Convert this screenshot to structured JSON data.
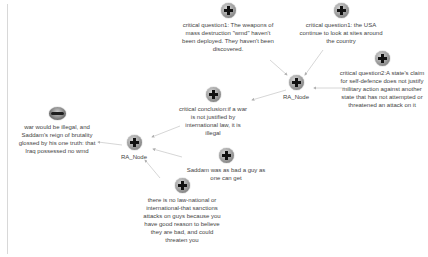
{
  "diagram": {
    "top_cutoff_text": "",
    "nodes": [
      {
        "id": "cq1",
        "icon": "plus-icon",
        "label": "critical question1: The weapons of mass destruction \"wmd\" haven't been deployed. They haven't been discovered."
      },
      {
        "id": "cq_usa",
        "icon": "plus-icon",
        "label": "critical question1: the USA continue to look at sites around the country"
      },
      {
        "id": "cq2",
        "icon": "plus-icon",
        "label": "critical question2:A state's claim for self-defence does not justify military action against another state that has not attempted or threatened an attack on it"
      },
      {
        "id": "ra1",
        "icon": "plus-icon",
        "label": "RA_Node"
      },
      {
        "id": "cc",
        "icon": "plus-icon",
        "label": "critical conclusion:if a war is not justified by international law, it is illegal"
      },
      {
        "id": "war",
        "icon": "ellipse-icon",
        "label": "war would be illegal, and Saddam's reign of brutality glossed by his one truth: that Iraq possessed no wmd"
      },
      {
        "id": "ra2",
        "icon": "plus-icon",
        "label": "RA_Node"
      },
      {
        "id": "saddam",
        "icon": "plus-icon",
        "label": "Saddam was as bad a guy as one can get"
      },
      {
        "id": "law",
        "icon": "plus-icon",
        "label": "there is no law-national or international-that sanctions attacks on guys because you have good reason to believe they are bad, and could threaten you"
      }
    ],
    "edges": [
      {
        "from": "cq1",
        "to": "ra1"
      },
      {
        "from": "cq_usa",
        "to": "ra1"
      },
      {
        "from": "cq2",
        "to": "ra1"
      },
      {
        "from": "ra1",
        "to": "cc"
      },
      {
        "from": "cc",
        "to": "ra2"
      },
      {
        "from": "saddam",
        "to": "ra2"
      },
      {
        "from": "law",
        "to": "ra2"
      },
      {
        "from": "ra2",
        "to": "war"
      }
    ],
    "colors": {
      "edge": "#c8c8c8",
      "text": "#444444",
      "background": "#ffffff"
    }
  }
}
